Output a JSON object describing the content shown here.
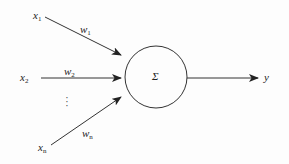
{
  "diagram": {
    "title": "",
    "type": "perceptron-neuron",
    "inputs": [
      {
        "id": "x1",
        "var": "x",
        "sub": "1",
        "weight_var": "w",
        "weight_sub": "1"
      },
      {
        "id": "x2",
        "var": "x",
        "sub": "2",
        "weight_var": "w",
        "weight_sub": "2"
      },
      {
        "id": "xn",
        "var": "x",
        "sub": "n",
        "weight_var": "w",
        "weight_sub": "n"
      }
    ],
    "ellipsis": "⋮",
    "node": {
      "symbol": "Σ",
      "shape": "circle"
    },
    "output": {
      "var": "y"
    },
    "colors": {
      "stroke": "#333333",
      "background": "#fdfdfd",
      "text": "#222222"
    }
  }
}
